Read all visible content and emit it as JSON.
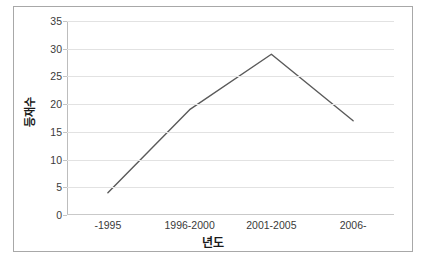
{
  "chart_data": {
    "type": "line",
    "title": "",
    "subtitle": "",
    "xlabel": "년도",
    "ylabel": "등재수",
    "categories": [
      "-1995",
      "1996-2000",
      "2001-2005",
      "2006-"
    ],
    "values": [
      4,
      19,
      29,
      17
    ],
    "series": [
      {
        "name": "등재수",
        "values": [
          4,
          19,
          29,
          17
        ]
      }
    ],
    "ylim": [
      0,
      35
    ],
    "ytick_values": [
      0,
      5,
      10,
      15,
      20,
      25,
      30,
      35
    ],
    "ytick_labels": [
      "0",
      "5",
      "10",
      "15",
      "20",
      "25",
      "30",
      "35"
    ],
    "grid": true,
    "grid_axis": "y",
    "legend": false,
    "legend_position": "none",
    "markers": false,
    "line_color": "#5a5a5a",
    "grid_color": "#e2e2e2",
    "axis_color": "#bdbdbd",
    "plot_background": "#ffffff",
    "figure_background": "#ffffff",
    "border_color": "#a8a8a8",
    "text_color": "#1a1a1a"
  },
  "watermark": {
    "text": ""
  }
}
